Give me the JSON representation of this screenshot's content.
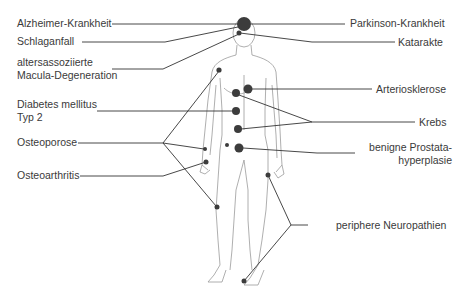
{
  "diagram": {
    "type": "body-disease-map",
    "colors": {
      "line": "#333333",
      "dot": "#3c3c3c",
      "body_outline": "#9a9a9a",
      "text": "#3a3a3a"
    },
    "labels_left": [
      {
        "id": "alzheimer",
        "text": "Alzheimer-Krankheit"
      },
      {
        "id": "schlaganfall",
        "text": "Schlaganfall"
      },
      {
        "id": "amd_1",
        "text": "altersassoziierte"
      },
      {
        "id": "amd_2",
        "text": "Macula-Degeneration"
      },
      {
        "id": "diabetes_1",
        "text": "Diabetes mellitus"
      },
      {
        "id": "diabetes_2",
        "text": "Typ 2"
      },
      {
        "id": "osteoporose",
        "text": "Osteoporose"
      },
      {
        "id": "osteoarthritis",
        "text": "Osteoarthritis"
      }
    ],
    "labels_right": [
      {
        "id": "parkinson",
        "text": "Parkinson-Krankheit"
      },
      {
        "id": "katarakte",
        "text": "Katarakte"
      },
      {
        "id": "arteriosklerose",
        "text": "Arteriosklerose"
      },
      {
        "id": "krebs",
        "text": "Krebs"
      },
      {
        "id": "bph_1",
        "text": "benigne Prostata-"
      },
      {
        "id": "bph_2",
        "text": "hyperplasie"
      },
      {
        "id": "neuropathien",
        "text": "periphere Neuropathien"
      }
    ]
  }
}
